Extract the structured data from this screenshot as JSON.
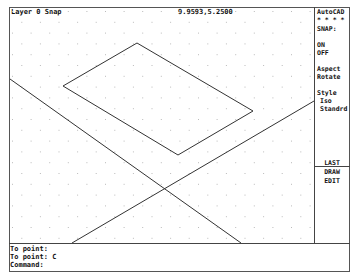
{
  "app": {
    "name": "AutoCAD"
  },
  "status_bar": {
    "layer_snap": "Layer 0 Snap",
    "coordinates": "9.9593,5.2500"
  },
  "side_menu": {
    "title": "AutoCAD",
    "stars": "* * * *",
    "items": [
      {
        "label": "SNAP:"
      },
      {
        "label": "ON"
      },
      {
        "label": "OFF"
      },
      {
        "label": "Aspect"
      },
      {
        "label": "Rotate"
      },
      {
        "label": "Style"
      },
      {
        "label": "Iso"
      },
      {
        "label": "Standrd"
      },
      {
        "label": "LAST"
      },
      {
        "label": "DRAW"
      },
      {
        "label": "EDIT"
      }
    ]
  },
  "command_area": {
    "lines": [
      "To point:",
      "To point: C",
      "Command:"
    ]
  },
  "drawing": {
    "snap_style": "isometric",
    "grid": "dot",
    "colors": {
      "line": "#333333",
      "grid_dot": "#bbbbbb",
      "background": "#ffffff"
    },
    "entities": [
      {
        "type": "polygon",
        "name": "isometric-rectangle",
        "points": [
          [
            137,
            43
          ],
          [
            63,
            86
          ],
          [
            178,
            155
          ],
          [
            253,
            111
          ]
        ]
      },
      {
        "type": "line",
        "name": "diagonal-line-1",
        "from": [
          10,
          79
        ],
        "to": [
          241,
          243
        ]
      },
      {
        "type": "line",
        "name": "diagonal-line-2",
        "from": [
          72,
          243
        ],
        "to": [
          314,
          101
        ]
      }
    ]
  }
}
